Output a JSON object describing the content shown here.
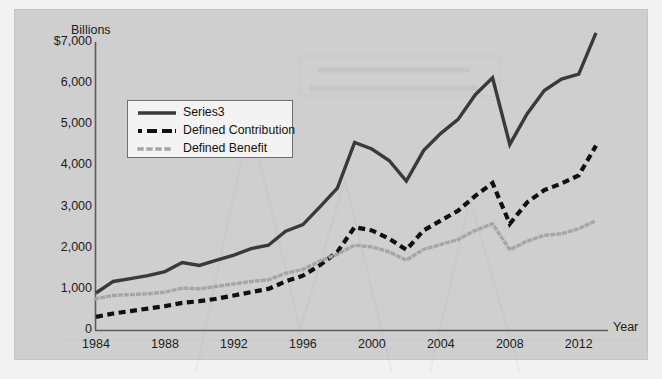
{
  "chart_data": {
    "type": "line",
    "title": "",
    "subtitle": "",
    "xlabel": "Year",
    "ylabel": "Billions",
    "ylim": [
      0,
      7000
    ],
    "xlim": [
      1984,
      2013
    ],
    "grid": false,
    "legend_position": "upper-left-inside",
    "y_ticks": [
      "$7,000",
      "6,000",
      "5,000",
      "4,000",
      "3,000",
      "2,000",
      "1,000",
      "0"
    ],
    "y_tick_values": [
      7000,
      6000,
      5000,
      4000,
      3000,
      2000,
      1000,
      0
    ],
    "x_ticks": [
      "1984",
      "1988",
      "1992",
      "1996",
      "2000",
      "2004",
      "2008",
      "2012"
    ],
    "x_tick_values": [
      1984,
      1988,
      1992,
      1996,
      2000,
      2004,
      2008,
      2012
    ],
    "x": [
      1984,
      1985,
      1986,
      1987,
      1988,
      1989,
      1990,
      1991,
      1992,
      1993,
      1994,
      1995,
      1996,
      1997,
      1998,
      1999,
      2000,
      2001,
      2002,
      2003,
      2004,
      2005,
      2006,
      2007,
      2008,
      2009,
      2010,
      2011,
      2012,
      2013
    ],
    "series": [
      {
        "name": "Series3",
        "style": "solid",
        "color": "#3a3a3a",
        "values": [
          900,
          1180,
          1250,
          1320,
          1420,
          1640,
          1570,
          1700,
          1820,
          1980,
          2060,
          2400,
          2560,
          3000,
          3450,
          4560,
          4400,
          4120,
          3620,
          4360,
          4780,
          5120,
          5720,
          6130,
          4510,
          5250,
          5820,
          6100,
          6220,
          7220
        ]
      },
      {
        "name": "Defined Contribution",
        "style": "dashed",
        "color": "#101010",
        "values": [
          320,
          400,
          460,
          520,
          580,
          660,
          700,
          760,
          840,
          920,
          1000,
          1180,
          1320,
          1580,
          1900,
          2500,
          2420,
          2220,
          1950,
          2420,
          2660,
          2900,
          3260,
          3570,
          2580,
          3100,
          3400,
          3560,
          3760,
          4480
        ]
      },
      {
        "name": "Defined Benefit",
        "style": "dotted",
        "color": "#a6a6a6",
        "values": [
          760,
          840,
          860,
          880,
          920,
          1020,
          1000,
          1060,
          1120,
          1180,
          1220,
          1380,
          1470,
          1680,
          1840,
          2060,
          2020,
          1900,
          1700,
          1960,
          2080,
          2200,
          2420,
          2580,
          1950,
          2160,
          2300,
          2340,
          2460,
          2660
        ]
      }
    ]
  },
  "legend": {
    "entries": [
      {
        "label": "Series3"
      },
      {
        "label": "Defined Contribution"
      },
      {
        "label": "Defined Benefit"
      }
    ]
  },
  "axes": {
    "y_title": "Billions",
    "x_title": "Year"
  }
}
